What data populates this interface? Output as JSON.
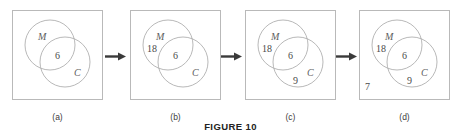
{
  "figure": {
    "caption": "FIGURE 10",
    "set_labels": {
      "m": "M",
      "c": "C"
    }
  },
  "panels": [
    {
      "caption": "(a)",
      "counts": {
        "intersection": "6",
        "m_only": "",
        "c_only": "",
        "outside": ""
      }
    },
    {
      "caption": "(b)",
      "counts": {
        "intersection": "6",
        "m_only": "18",
        "c_only": "",
        "outside": ""
      }
    },
    {
      "caption": "(c)",
      "counts": {
        "intersection": "6",
        "m_only": "18",
        "c_only": "9",
        "outside": ""
      }
    },
    {
      "caption": "(d)",
      "counts": {
        "intersection": "6",
        "m_only": "18",
        "c_only": "9",
        "outside": "7"
      }
    }
  ],
  "arrows": [
    {
      "name": "arrow-a-to-b"
    },
    {
      "name": "arrow-b-to-c"
    },
    {
      "name": "arrow-c-to-d"
    }
  ],
  "colors": {
    "box_border": "#b9b9b9",
    "circle_stroke": "#b0b0b0",
    "arrow": "#3a3a3a",
    "text": "#4a4a4a",
    "caption": "#222222",
    "background": "#ffffff"
  }
}
